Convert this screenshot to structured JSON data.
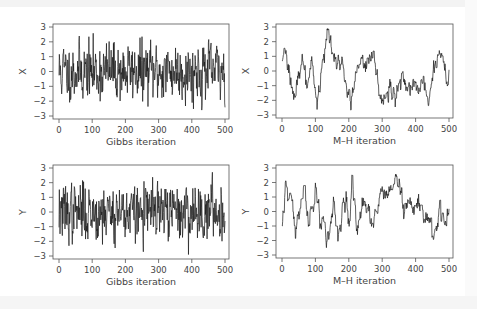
{
  "chart_data": [
    {
      "type": "line",
      "panel": "top-left",
      "title": "",
      "xlabel": "Gibbs iteration",
      "ylabel": "X",
      "xlim": [
        0,
        500
      ],
      "ylim": [
        -3,
        3
      ],
      "xticks": [
        "0",
        "100",
        "200",
        "300",
        "400",
        "500"
      ],
      "yticks": [
        "3",
        "2",
        "1",
        "0",
        "-1",
        "-2",
        "-3"
      ],
      "grid": false,
      "description": "Rapidly mixing trace plot (Gibbs sampler) for X, values fluctuating roughly between -2.9 and 2.8 around 0",
      "series": [
        {
          "name": "X",
          "seed": 11,
          "kind": "iid",
          "scale": 1.0
        }
      ]
    },
    {
      "type": "line",
      "panel": "top-right",
      "title": "",
      "xlabel": "M–H iteration",
      "ylabel": "X",
      "xlim": [
        0,
        500
      ],
      "ylim": [
        -3,
        3
      ],
      "xticks": [
        "0",
        "100",
        "200",
        "300",
        "400",
        "500"
      ],
      "yticks": [
        "3",
        "2",
        "1",
        "0",
        "-1",
        "-2",
        "-3"
      ],
      "grid": false,
      "description": "Slowly mixing Metropolis-Hastings trace for X, strongly autocorrelated, range about -2.5 to 2.8",
      "series": [
        {
          "name": "X",
          "seed": 23,
          "kind": "ar",
          "anchors": [
            [
              0,
              1.0
            ],
            [
              10,
              1.1
            ],
            [
              30,
              -1.5
            ],
            [
              40,
              -1.2
            ],
            [
              60,
              0.6
            ],
            [
              75,
              -1.2
            ],
            [
              90,
              0.5
            ],
            [
              105,
              -2.4
            ],
            [
              120,
              0.8
            ],
            [
              140,
              2.6
            ],
            [
              160,
              0.5
            ],
            [
              180,
              0.4
            ],
            [
              205,
              -2.0
            ],
            [
              230,
              0.8
            ],
            [
              250,
              0.0
            ],
            [
              270,
              1.6
            ],
            [
              290,
              -1.5
            ],
            [
              300,
              -2.2
            ],
            [
              320,
              -1.3
            ],
            [
              340,
              -1.8
            ],
            [
              360,
              -0.3
            ],
            [
              380,
              -1.2
            ],
            [
              400,
              -1.0
            ],
            [
              420,
              -1.2
            ],
            [
              440,
              -2.0
            ],
            [
              460,
              0.3
            ],
            [
              470,
              1.4
            ],
            [
              485,
              0.6
            ],
            [
              495,
              -1.0
            ],
            [
              500,
              -0.6
            ]
          ]
        }
      ]
    },
    {
      "type": "line",
      "panel": "bottom-left",
      "title": "",
      "xlabel": "Gibbs iteration",
      "ylabel": "Y",
      "xlim": [
        0,
        500
      ],
      "ylim": [
        -3,
        3
      ],
      "xticks": [
        "0",
        "100",
        "200",
        "300",
        "400",
        "500"
      ],
      "yticks": [
        "3",
        "2",
        "1",
        "0",
        "-1",
        "-2",
        "-3"
      ],
      "grid": false,
      "description": "Rapidly mixing trace plot (Gibbs sampler) for Y, values fluctuating roughly between -2.8 and 3.1 around 0",
      "series": [
        {
          "name": "Y",
          "seed": 37,
          "kind": "iid",
          "scale": 1.0
        }
      ]
    },
    {
      "type": "line",
      "panel": "bottom-right",
      "title": "",
      "xlabel": "M–H iteration",
      "ylabel": "Y",
      "xlim": [
        0,
        500
      ],
      "ylim": [
        -3,
        3
      ],
      "xticks": [
        "0",
        "100",
        "200",
        "300",
        "400",
        "500"
      ],
      "yticks": [
        "3",
        "2",
        "1",
        "0",
        "-1",
        "-2",
        "-3"
      ],
      "grid": false,
      "description": "Slowly mixing Metropolis-Hastings trace for Y, strongly autocorrelated, range about -2.4 to 2.4",
      "series": [
        {
          "name": "Y",
          "seed": 51,
          "kind": "ar",
          "anchors": [
            [
              0,
              -1.0
            ],
            [
              5,
              0.5
            ],
            [
              12,
              2.2
            ],
            [
              25,
              1.2
            ],
            [
              40,
              -1.5
            ],
            [
              55,
              0.2
            ],
            [
              65,
              1.3
            ],
            [
              80,
              -0.8
            ],
            [
              95,
              0.3
            ],
            [
              100,
              1.7
            ],
            [
              115,
              -0.8
            ],
            [
              125,
              -1.0
            ],
            [
              135,
              -2.3
            ],
            [
              155,
              0.5
            ],
            [
              165,
              -1.9
            ],
            [
              185,
              0.5
            ],
            [
              195,
              0.6
            ],
            [
              200,
              -1.0
            ],
            [
              210,
              2.3
            ],
            [
              225,
              -1.8
            ],
            [
              240,
              0.5
            ],
            [
              260,
              0.0
            ],
            [
              270,
              -0.9
            ],
            [
              285,
              0.2
            ],
            [
              300,
              1.7
            ],
            [
              310,
              0.5
            ],
            [
              330,
              1.8
            ],
            [
              340,
              2.2
            ],
            [
              355,
              1.5
            ],
            [
              365,
              0.2
            ],
            [
              380,
              0.9
            ],
            [
              395,
              -0.3
            ],
            [
              410,
              0.8
            ],
            [
              425,
              -0.2
            ],
            [
              440,
              -1.0
            ],
            [
              455,
              -2.1
            ],
            [
              470,
              0.3
            ],
            [
              480,
              -0.2
            ],
            [
              490,
              -1.0
            ],
            [
              500,
              0.1
            ]
          ]
        }
      ]
    }
  ]
}
